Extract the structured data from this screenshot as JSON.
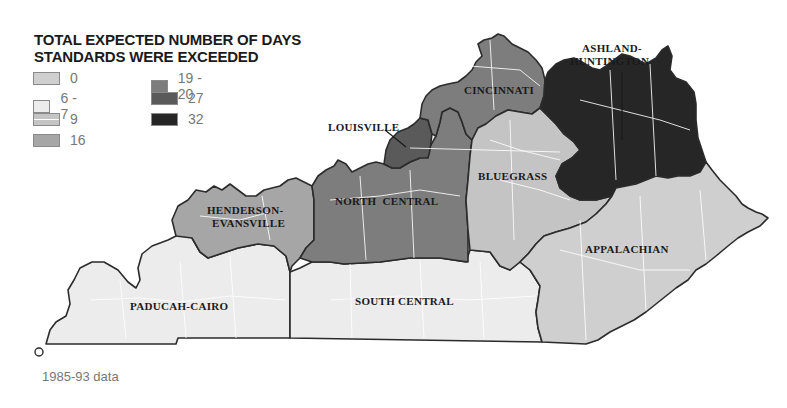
{
  "legend": {
    "title_line1": "TOTAL EXPECTED NUMBER OF DAYS",
    "title_line2": "STANDARDS WERE EXCEEDED",
    "items": [
      {
        "label": "0",
        "color": "#cfcfcf"
      },
      {
        "label": "6 - 7",
        "color": "#ececec"
      },
      {
        "label": "9",
        "color": "#c4c4c4"
      },
      {
        "label": "16",
        "color": "#a6a6a6"
      },
      {
        "label": "19 - 20",
        "color": "#7d7d7d"
      },
      {
        "label": "27",
        "color": "#5a5a5a"
      },
      {
        "label": "32",
        "color": "#262626"
      }
    ]
  },
  "regions": [
    {
      "name": "PADUCAH-CAIRO",
      "value": "6 - 7",
      "color": "#ececec"
    },
    {
      "name": "HENDERSON-EVANSVILLE",
      "value": "16",
      "color": "#a6a6a6"
    },
    {
      "name": "NORTH CENTRAL",
      "value": "19 - 20",
      "color": "#7d7d7d"
    },
    {
      "name": "LOUISVILLE",
      "value": "27",
      "color": "#5a5a5a"
    },
    {
      "name": "CINCINNATI",
      "value": "19 - 20",
      "color": "#7d7d7d"
    },
    {
      "name": "BLUEGRASS",
      "value": "9",
      "color": "#c4c4c4"
    },
    {
      "name": "ASHLAND-HUNTINGTON",
      "value": "32",
      "color": "#262626"
    },
    {
      "name": "APPALACHIAN",
      "value": "0",
      "color": "#cfcfcf"
    },
    {
      "name": "SOUTH CENTRAL",
      "value": "6 - 7",
      "color": "#ececec"
    }
  ],
  "labels": {
    "paducah": "PADUCAH-CAIRO",
    "henderson_1": "HENDERSON-",
    "henderson_2": "EVANSVILLE",
    "north_central": "NORTH  CENTRAL",
    "louisville": "LOUISVILLE",
    "cincinnati": "CINCINNATI",
    "bluegrass": "BLUEGRASS",
    "ashland_1": "ASHLAND-",
    "ashland_2": "HUNTINGTON",
    "appalachian": "APPALACHIAN",
    "south_central": "SOUTH CENTRAL"
  },
  "footnote": "1985-93 data"
}
